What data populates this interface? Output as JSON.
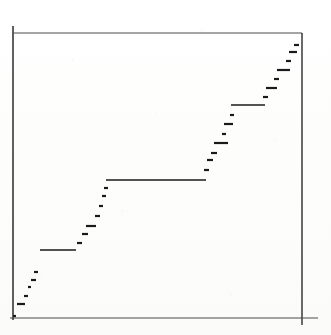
{
  "figure": {
    "kind": "scanned-plot",
    "background_color": "#fdfdfc",
    "ink_color": "#1a1a1a",
    "width": 331,
    "height": 335
  },
  "chart_data": {
    "type": "line",
    "title": "",
    "subtitle": "",
    "xlabel": "",
    "ylabel": "",
    "legend": [],
    "grid": false,
    "legend_position": "none",
    "axis": {
      "frame": "box",
      "x_axis_range_px": [
        13,
        302
      ],
      "y_axis_range_px": [
        33,
        318
      ],
      "x_tick_labels": [],
      "y_tick_labels": [],
      "xlim": [
        0,
        1
      ],
      "ylim": [
        0,
        1
      ]
    },
    "series": [
      {
        "name": "empirical step function",
        "marker": "horizontal-dash",
        "color": "#1a1a1a",
        "steps_px": [
          {
            "x0": 13,
            "x1": 16,
            "y": 316
          },
          {
            "x0": 17,
            "x1": 25,
            "y": 304
          },
          {
            "x0": 24,
            "x1": 28,
            "y": 296
          },
          {
            "x0": 28,
            "x1": 31,
            "y": 287
          },
          {
            "x0": 31,
            "x1": 36,
            "y": 280
          },
          {
            "x0": 40,
            "x1": 76,
            "y": 250
          },
          {
            "x0": 34,
            "x1": 38,
            "y": 272
          },
          {
            "x0": 77,
            "x1": 82,
            "y": 243
          },
          {
            "x0": 82,
            "x1": 88,
            "y": 234
          },
          {
            "x0": 86,
            "x1": 96,
            "y": 226
          },
          {
            "x0": 95,
            "x1": 100,
            "y": 216
          },
          {
            "x0": 99,
            "x1": 103,
            "y": 206
          },
          {
            "x0": 102,
            "x1": 106,
            "y": 196
          },
          {
            "x0": 104,
            "x1": 108,
            "y": 188
          },
          {
            "x0": 106,
            "x1": 206,
            "y": 180
          },
          {
            "x0": 204,
            "x1": 209,
            "y": 170
          },
          {
            "x0": 207,
            "x1": 213,
            "y": 160
          },
          {
            "x0": 211,
            "x1": 217,
            "y": 153
          },
          {
            "x0": 214,
            "x1": 228,
            "y": 143
          },
          {
            "x0": 222,
            "x1": 226,
            "y": 134
          },
          {
            "x0": 224,
            "x1": 233,
            "y": 124
          },
          {
            "x0": 230,
            "x1": 234,
            "y": 115
          },
          {
            "x0": 231,
            "x1": 265,
            "y": 105
          },
          {
            "x0": 263,
            "x1": 268,
            "y": 97
          },
          {
            "x0": 266,
            "x1": 277,
            "y": 88
          },
          {
            "x0": 274,
            "x1": 279,
            "y": 79
          },
          {
            "x0": 277,
            "x1": 290,
            "y": 70
          },
          {
            "x0": 286,
            "x1": 291,
            "y": 61
          },
          {
            "x0": 289,
            "x1": 297,
            "y": 52
          },
          {
            "x0": 294,
            "x1": 299,
            "y": 45
          }
        ]
      }
    ]
  }
}
